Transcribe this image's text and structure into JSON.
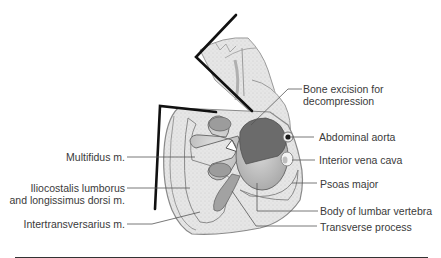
{
  "figure": {
    "type": "anatomical-cross-section",
    "colors": {
      "outline": "#1a1a1a",
      "leader_line": "#555555",
      "muscle_fill": "#e4e4e4",
      "bone_fill": "#cfcfcf",
      "excision_fill": "#6b6b6b",
      "text": "#3a3a3a"
    }
  },
  "labels": {
    "right": [
      {
        "id": "bone-excision",
        "line1": "Bone excision for",
        "line2": "decompression"
      },
      {
        "id": "abdominal-aorta",
        "text": "Abdominal aorta"
      },
      {
        "id": "inferior-vena-cava",
        "text": "Interior vena cava"
      },
      {
        "id": "psoas-major",
        "text": "Psoas major"
      },
      {
        "id": "body-lumbar-vertebra",
        "text": "Body of lumbar vertebra"
      },
      {
        "id": "transverse-process",
        "text": "Transverse process"
      }
    ],
    "left": [
      {
        "id": "multifidus",
        "text": "Multifidus m."
      },
      {
        "id": "iliocostalis",
        "line1": "Iliocostalis lumborus",
        "line2": "and longissimus dorsi m."
      },
      {
        "id": "intertransversarius",
        "text": "Intertransversarius m."
      }
    ]
  }
}
